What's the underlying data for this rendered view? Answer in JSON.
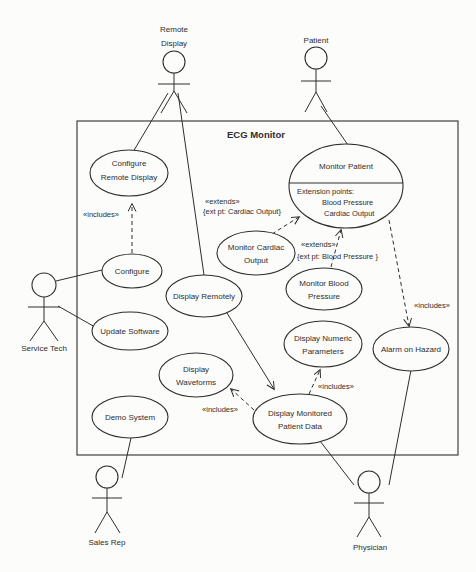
{
  "system": {
    "name": "ECG Monitor"
  },
  "actors": {
    "remote_display": {
      "name_line1": "Remote",
      "name_line2": "Display"
    },
    "patient": {
      "name": "Patient"
    },
    "service_tech": {
      "name": "Service Tech"
    },
    "sales_rep": {
      "name": "Sales Rep"
    },
    "physician": {
      "name": "Physician"
    }
  },
  "use_cases": {
    "configure_remote_display": {
      "line1": "Configure",
      "line2": "Remote Display"
    },
    "configure": {
      "line1": "Configure"
    },
    "update_software": {
      "line1": "Update Software"
    },
    "demo_system": {
      "line1": "Demo System"
    },
    "display_remotely": {
      "line1": "Display Remotely"
    },
    "display_waveforms": {
      "line1": "Display",
      "line2": "Waveforms"
    },
    "monitor_cardiac_output": {
      "line1": "Monitor Cardiac",
      "line2": "Output"
    },
    "monitor_blood_pressure": {
      "line1": "Monitor Blood",
      "line2": "Pressure"
    },
    "display_numeric_parameters": {
      "line1": "Display Numeric",
      "line2": "Parameters"
    },
    "display_monitored_patient_data": {
      "line1": "Display Monitored",
      "line2": "Patient Data"
    },
    "alarm_on_hazard": {
      "line1": "Alarm on Hazard"
    },
    "monitor_patient": {
      "title": "Monitor Patient",
      "extension_header": "Extension points:",
      "extension_point1": "Blood Pressure",
      "extension_point2": "Cardiac Output"
    }
  },
  "relationships": {
    "includes_configure": "«includes»",
    "includes_waveforms": "«includes»",
    "includes_numeric": "«includes»",
    "includes_alarm": "«includes»",
    "extends_cardiac": "«extends»",
    "extends_cardiac_pt": "{ext pt: Cardiac Output}",
    "extends_bp": "«extends»",
    "extends_bp_pt": "{ext pt: Blood Pressure }"
  },
  "colors": {
    "ink": "#2e2e2e",
    "paper": "#fcfcfb"
  }
}
